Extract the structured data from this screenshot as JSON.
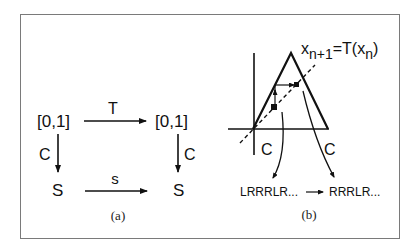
{
  "panel_a": {
    "top_left": "[0,1]",
    "top_right": "[0,1]",
    "bottom_left": "S",
    "bottom_right": "S",
    "top_arrow_label": "T",
    "bottom_arrow_label": "s",
    "left_arrow_label": "C",
    "right_arrow_label": "C",
    "caption": "(a)"
  },
  "panel_b": {
    "equation_x": "x",
    "equation_sub1": "n+1",
    "equation_mid": "=T(x",
    "equation_sub2": "n",
    "equation_end": ")",
    "left_coding_label": "C",
    "right_coding_label": "C",
    "sequence_before": "LRRRLR...",
    "sequence_after": "RRRLR...",
    "caption": "(b)"
  },
  "colors": {
    "ink": "#111111",
    "frame": "#7a7a7a"
  }
}
